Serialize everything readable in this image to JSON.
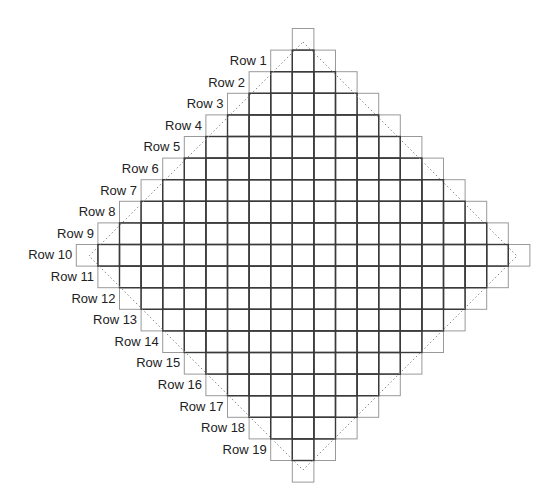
{
  "diagram": {
    "grid": {
      "size": 21,
      "origin_x": 76.3,
      "origin_y": 28.5,
      "cell": 21.6,
      "outer_cell_stroke": "#999999",
      "inner_cell_stroke": "#3a3a3a",
      "dashed_stroke": "#888888"
    },
    "dashed_diamond": {
      "center_x": 303,
      "center_y": 256,
      "half_diagonal": 214
    },
    "rows": [
      {
        "label": "Row 1"
      },
      {
        "label": "Row 2"
      },
      {
        "label": "Row 3"
      },
      {
        "label": "Row 4"
      },
      {
        "label": "Row 5"
      },
      {
        "label": "Row 6"
      },
      {
        "label": "Row 7"
      },
      {
        "label": "Row 8"
      },
      {
        "label": "Row 9"
      },
      {
        "label": "Row 10"
      },
      {
        "label": "Row 11"
      },
      {
        "label": "Row 12"
      },
      {
        "label": "Row 13"
      },
      {
        "label": "Row 14"
      },
      {
        "label": "Row 15"
      },
      {
        "label": "Row 16"
      },
      {
        "label": "Row 17"
      },
      {
        "label": "Row 18"
      },
      {
        "label": "Row 19"
      }
    ]
  }
}
